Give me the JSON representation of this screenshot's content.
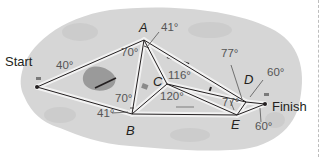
{
  "diagram": {
    "type": "orienteering-course-map",
    "colors": {
      "terrain": "#d6d6d6",
      "terrain_dark": "#c4c4c4",
      "path_line": "#231f20",
      "path_highlight": "#f2f2f2",
      "angle_text": "#555555",
      "label_text": "#231f20",
      "pond": "#9a9a9a"
    },
    "places": {
      "start": {
        "label": "Start",
        "x": 37,
        "y": 87
      },
      "finish": {
        "label": "Finish",
        "x": 265,
        "y": 104
      }
    },
    "vertices": {
      "A": {
        "label": "A",
        "x": 144,
        "y": 40
      },
      "B": {
        "label": "B",
        "x": 132,
        "y": 114
      },
      "C": {
        "label": "C",
        "x": 167,
        "y": 84
      },
      "D": {
        "label": "D",
        "x": 246,
        "y": 102
      },
      "E": {
        "label": "E",
        "x": 237,
        "y": 115
      }
    },
    "edges": [
      [
        "Start",
        "A"
      ],
      [
        "Start",
        "B"
      ],
      [
        "A",
        "B"
      ],
      [
        "A",
        "C"
      ],
      [
        "B",
        "C"
      ],
      [
        "A",
        "D"
      ],
      [
        "C",
        "D"
      ],
      [
        "C",
        "E"
      ],
      [
        "B",
        "E"
      ],
      [
        "D",
        "E"
      ],
      [
        "D",
        "Finish"
      ],
      [
        "E",
        "Finish"
      ]
    ],
    "angles": {
      "start": "40°",
      "a_left": "70°",
      "a_top": "41°",
      "b_left": "70°",
      "b_bottom": "41°",
      "c_top": "116°",
      "c_bottom": "120°",
      "d_top": "77°",
      "d_right": "60°",
      "e_top": "77°",
      "finish_bottom": "60°"
    }
  }
}
